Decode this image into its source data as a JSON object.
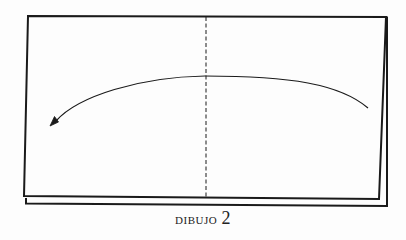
{
  "figure": {
    "caption_word": "Dibujo",
    "caption_number": "2",
    "colors": {
      "background": "#fdfdfd",
      "stroke": "#1a1a1a"
    },
    "elements": [
      "paper-front-sheet",
      "paper-back-sheet",
      "center-fold-line-dashed",
      "curved-arrow-right-to-left"
    ]
  }
}
